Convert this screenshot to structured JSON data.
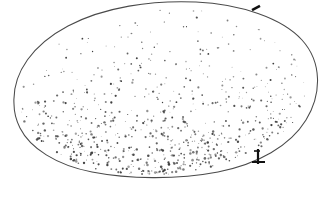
{
  "figure": {
    "background_color": "#ffffff",
    "outline_color": "#4a4a4a",
    "stipple_color": "#3c3c3c",
    "mark_color": "#111111",
    "caption": "",
    "width": 336,
    "height": 201
  },
  "chart_data": {
    "type": "scatter",
    "subtitle": "",
    "xlabel": "",
    "ylabel": "",
    "xlim": [
      0,
      336
    ],
    "ylim": [
      0,
      201
    ],
    "grid": false,
    "legend_position": "none",
    "tick_labels_x": [],
    "tick_labels_y": [],
    "annotations": [
      {
        "name": "top-edge-tick",
        "x": 256,
        "y": 8,
        "angle": -28,
        "length": 9,
        "width": 2.6,
        "description": "short dark tick on upper-right outline"
      },
      {
        "name": "bottom-edge-marker",
        "x": 258,
        "y": 156,
        "description": "dark T-shaped anchor marker on lower-right outline"
      }
    ],
    "outline": {
      "shape": "closed-oval",
      "center": [
        166,
        92
      ],
      "rx": 152,
      "ry": 85,
      "rotation_deg": -6,
      "path": "M 14 104 C 12 72 34 44 68 26 C 104 7 152 0 196 2 C 240 4 282 18 302 40 C 322 62 322 94 306 120 C 290 146 258 164 218 172 C 176 180 128 179 92 172 C 56 165 30 148 20 128 C 16 120 14 112 14 104 Z"
    },
    "series": [
      {
        "name": "stipple-dots",
        "count": 760,
        "description": "random specks, density increases toward the lower portion of the oval",
        "density_gradient": "low at top, high at bottom",
        "dot_size_range": [
          0.35,
          1.35
        ]
      }
    ]
  }
}
